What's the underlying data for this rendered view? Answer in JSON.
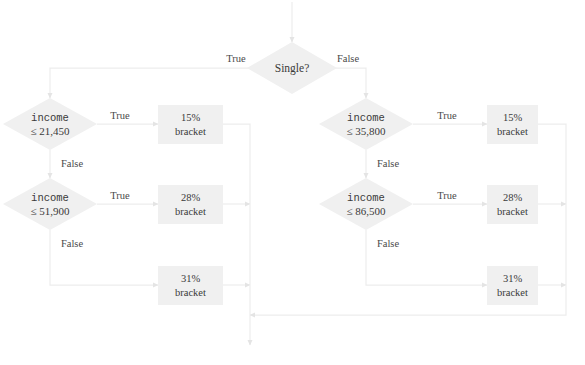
{
  "diagram": {
    "type": "flowchart",
    "colors": {
      "node_fill": "#f0f0f0",
      "edge_stroke": "#e8e8e8",
      "text": "#3a3a3a"
    },
    "entry": {
      "name": "entry-arrow"
    },
    "root": {
      "id": "single",
      "shape": "diamond",
      "label": "Single?"
    },
    "edge_labels": {
      "root_true": "True",
      "root_false": "False",
      "true": "True",
      "false": "False"
    },
    "branches": [
      {
        "id": "single-yes",
        "side": "left",
        "from_label": "True",
        "decisions": [
          {
            "id": "left-d1",
            "shape": "diamond",
            "line1": "income",
            "line2": "≤ 21,450",
            "true_label": "True",
            "false_label": "False",
            "result": {
              "id": "left-r1",
              "shape": "box",
              "line1": "15%",
              "line2": "bracket"
            }
          },
          {
            "id": "left-d2",
            "shape": "diamond",
            "line1": "income",
            "line2": "≤ 51,900",
            "true_label": "True",
            "false_label": "False",
            "result": {
              "id": "left-r2",
              "shape": "box",
              "line1": "28%",
              "line2": "bracket"
            }
          }
        ],
        "fallback": {
          "id": "left-r3",
          "shape": "box",
          "line1": "31%",
          "line2": "bracket"
        }
      },
      {
        "id": "single-no",
        "side": "right",
        "from_label": "False",
        "decisions": [
          {
            "id": "right-d1",
            "shape": "diamond",
            "line1": "income",
            "line2": "≤ 35,800",
            "true_label": "True",
            "false_label": "False",
            "result": {
              "id": "right-r1",
              "shape": "box",
              "line1": "15%",
              "line2": "bracket"
            }
          },
          {
            "id": "right-d2",
            "shape": "diamond",
            "line1": "income",
            "line2": "≤ 86,500",
            "true_label": "True",
            "false_label": "False",
            "result": {
              "id": "right-r2",
              "shape": "box",
              "line1": "28%",
              "line2": "bracket"
            }
          }
        ],
        "fallback": {
          "id": "right-r3",
          "shape": "box",
          "line1": "31%",
          "line2": "bracket"
        }
      }
    ]
  }
}
